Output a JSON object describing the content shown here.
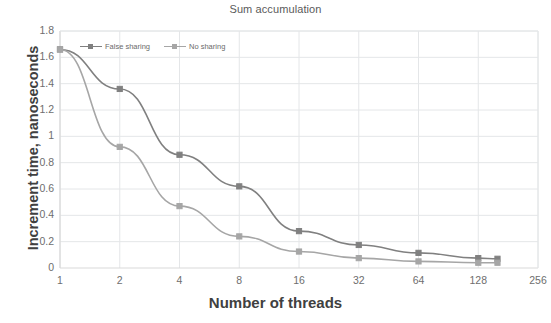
{
  "chart_data": {
    "type": "line",
    "title": "Sum accumulation",
    "xlabel": "Number of threads",
    "ylabel": "Increment time, nanoseconds",
    "x_scale": "log2",
    "x": [
      1,
      2,
      4,
      8,
      16,
      32,
      64,
      128,
      160
    ],
    "x_tick_labels": [
      "1",
      "2",
      "4",
      "8",
      "16",
      "32",
      "64",
      "128",
      "256"
    ],
    "x_tick_values": [
      1,
      2,
      4,
      8,
      16,
      32,
      64,
      128,
      256
    ],
    "xlim": [
      1,
      256
    ],
    "y_tick_labels": [
      "0",
      "0.2",
      "0.4",
      "0.6",
      "0.8",
      "1",
      "1.2",
      "1.4",
      "1.6",
      "1.8"
    ],
    "y_tick_values": [
      0,
      0.2,
      0.4,
      0.6,
      0.8,
      1,
      1.2,
      1.4,
      1.6,
      1.8
    ],
    "ylim": [
      0,
      1.8
    ],
    "grid": "horizontal-and-vertical",
    "legend_position": "top-left-inside",
    "series": [
      {
        "name": "False sharing",
        "color": "#808080",
        "x": [
          1,
          2,
          4,
          8,
          16,
          32,
          64,
          128,
          160
        ],
        "values": [
          1.66,
          1.36,
          0.86,
          0.62,
          0.28,
          0.175,
          0.115,
          0.075,
          0.07
        ]
      },
      {
        "name": "No sharing",
        "color": "#a6a6a6",
        "x": [
          1,
          2,
          4,
          8,
          16,
          32,
          64,
          128,
          160
        ],
        "values": [
          1.66,
          0.92,
          0.47,
          0.24,
          0.125,
          0.075,
          0.05,
          0.04,
          0.04
        ]
      }
    ]
  },
  "colors": {
    "series_false_sharing": "#808080",
    "series_no_sharing": "#a6a6a6",
    "grid": "#e4e6e8",
    "axis": "#d9d9d9",
    "text": "#6e6e6e",
    "label_text": "#404040",
    "background": "#ffffff"
  }
}
